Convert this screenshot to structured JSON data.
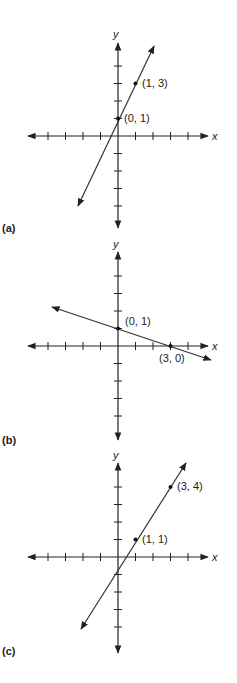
{
  "header_fragment": "",
  "graphs": [
    {
      "id": "a",
      "panel_label": "(a)",
      "x_axis_label": "x",
      "y_axis_label": "y",
      "origin_px": [
        118,
        136
      ],
      "unit_px": 17.5,
      "points": [
        {
          "label": "(0, 1)",
          "x": 0,
          "y": 1
        },
        {
          "label": "(1, 3)",
          "x": 1,
          "y": 3
        }
      ],
      "line": {
        "slope": 2,
        "intercept": 1,
        "x_from": -2.2,
        "x_to": 2
      }
    },
    {
      "id": "b",
      "panel_label": "(b)",
      "x_axis_label": "x",
      "y_axis_label": "y",
      "origin_px": [
        118,
        346
      ],
      "unit_px": 17.5,
      "points": [
        {
          "label": "(0, 1)",
          "x": 0,
          "y": 1
        },
        {
          "label": "(3, 0)",
          "x": 3,
          "y": 0
        }
      ],
      "line": {
        "slope": -0.3333,
        "intercept": 1,
        "x_from": -4,
        "x_to": 4.4
      }
    },
    {
      "id": "c",
      "panel_label": "(c)",
      "x_axis_label": "x",
      "y_axis_label": "y",
      "origin_px": [
        118,
        557
      ],
      "unit_px": 17.5,
      "points": [
        {
          "label": "(1, 1)",
          "x": 1,
          "y": 1
        },
        {
          "label": "(3, 4)",
          "x": 3,
          "y": 4
        }
      ],
      "line": {
        "slope": 1.5,
        "intercept": -0.5,
        "x_from": -2.1,
        "x_to": 3.9
      }
    }
  ]
}
